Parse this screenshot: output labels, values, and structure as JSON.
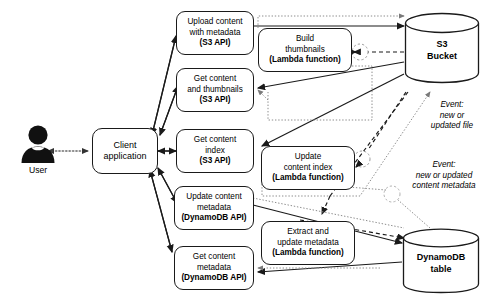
{
  "diagram": {
    "actor": {
      "icon": "user-avatar-icon",
      "label": "User"
    },
    "client": {
      "lines": [
        "Client",
        "application"
      ]
    },
    "api_nodes": [
      {
        "id": "upload-content",
        "lines": [
          "Upload content",
          "with metadata"
        ],
        "api": "(S3 API)"
      },
      {
        "id": "get-content-thumbnails",
        "lines": [
          "Get content",
          "and thumbnails"
        ],
        "api": "(S3 API)"
      },
      {
        "id": "get-content-index",
        "lines": [
          "Get content",
          "index"
        ],
        "api": "(S3 API)"
      },
      {
        "id": "update-content-metadata",
        "lines": [
          "Update content",
          "metadata"
        ],
        "api": "(DynamoDB API)"
      },
      {
        "id": "get-content-metadata",
        "lines": [
          "Get content",
          "metadata"
        ],
        "api": "(DynamoDB API)"
      }
    ],
    "lambda_nodes": [
      {
        "id": "build-thumbnails",
        "lines": [
          "Build",
          "thumbnails"
        ],
        "runtime": "(Lambda function)"
      },
      {
        "id": "update-content-index",
        "lines": [
          "Update",
          "content index"
        ],
        "runtime": "(Lambda function)"
      },
      {
        "id": "extract-update-metadata",
        "lines": [
          "Extract and",
          "update metadata"
        ],
        "runtime": "(Lambda function)"
      }
    ],
    "stores": [
      {
        "id": "s3-bucket",
        "lines": [
          "S3",
          "Bucket"
        ]
      },
      {
        "id": "dynamodb-table",
        "lines": [
          "DynamoDB",
          "table"
        ]
      }
    ],
    "event_labels": [
      {
        "id": "event-new-updated-file",
        "lines": [
          "Event:",
          "new or",
          "updated file"
        ]
      },
      {
        "id": "event-new-updated-metadata",
        "lines": [
          "Event:",
          "new or updated",
          "content metadata"
        ]
      }
    ],
    "colors": {
      "stroke": "#1a1a1a",
      "background": "#ffffff",
      "text": "#000000",
      "dotted": "#8c8c8c"
    }
  }
}
